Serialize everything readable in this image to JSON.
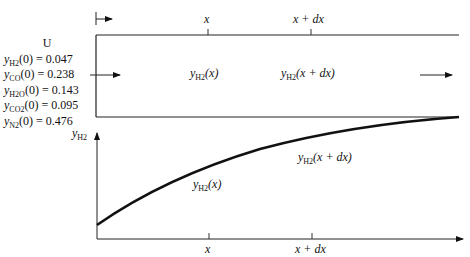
{
  "diagram": {
    "reactor": {
      "top_markers": [
        {
          "id": "x",
          "label": "x"
        },
        {
          "id": "x_plus_dx",
          "label": "x + dx"
        }
      ],
      "inner_labels": [
        {
          "id": "yh2_x",
          "symbol": "y",
          "sub": "H2",
          "arg": "(x)"
        },
        {
          "id": "yh2_xdx",
          "symbol": "y",
          "sub": "H2",
          "arg": "(x + dx)"
        }
      ]
    },
    "inlet": {
      "velocity_label": "U",
      "compositions": [
        {
          "species_sub": "H2",
          "expr": "(0) = 0.047",
          "value": 0.047
        },
        {
          "species_sub": "CO",
          "expr": "(0) = 0.238",
          "value": 0.238
        },
        {
          "species_sub": "H2O",
          "expr": "(0) = 0.143",
          "value": 0.143
        },
        {
          "species_sub": "CO2",
          "expr": "(0) = 0.095",
          "value": 0.095
        },
        {
          "species_sub": "N2",
          "expr": "(0) = 0.476",
          "value": 0.476
        }
      ]
    },
    "plot": {
      "y_axis_label_symbol": "y",
      "y_axis_label_sub": "H2",
      "curve_labels": [
        {
          "id": "curve_x",
          "symbol": "y",
          "sub": "H2",
          "arg": "(x)"
        },
        {
          "id": "curve_xdx",
          "symbol": "y",
          "sub": "H2",
          "arg": "(x + dx)"
        }
      ],
      "x_ticks": [
        {
          "label": "x"
        },
        {
          "label": "x + dx"
        }
      ]
    }
  }
}
